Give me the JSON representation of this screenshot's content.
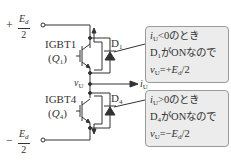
{
  "diagram": {
    "top_supply": {
      "sign": "+",
      "numerator": "E",
      "numerator_sub": "d",
      "denominator": "2"
    },
    "bottom_supply": {
      "sign": "−",
      "numerator": "E",
      "numerator_sub": "d",
      "denominator": "2"
    },
    "igbt1": {
      "name": "IGBT1",
      "symbol": "Q",
      "symbol_sub": "1"
    },
    "igbt4": {
      "name": "IGBT4",
      "symbol": "Q",
      "symbol_sub": "4"
    },
    "diode1": {
      "symbol": "D",
      "sub": "1"
    },
    "diode4": {
      "symbol": "D",
      "sub": "4"
    },
    "output_voltage": {
      "symbol": "v",
      "sub": "U"
    },
    "output_current": {
      "symbol": "i",
      "sub": "U"
    },
    "callout_top": {
      "line1_var": "i",
      "line1_sub": "U",
      "line1_rest": "<0のとき",
      "line2_var": "D",
      "line2_sub": "1",
      "line2_rest": "がONなので",
      "line3_var": "v",
      "line3_sub": "U",
      "line3_eq": "=+",
      "line3_E": "E",
      "line3_E_sub": "d",
      "line3_tail": "/2"
    },
    "callout_bottom": {
      "line1_var": "i",
      "line1_sub": "U",
      "line1_rest": ">0のとき",
      "line2_var": "D",
      "line2_sub": "4",
      "line2_rest": "がONなので",
      "line3_var": "v",
      "line3_sub": "U",
      "line3_eq": "=−",
      "line3_E": "E",
      "line3_E_sub": "d",
      "line3_tail": "/2"
    },
    "colors": {
      "line": "#333333",
      "callout_bg": "#ececec",
      "callout_border": "#9a9a9a"
    }
  }
}
